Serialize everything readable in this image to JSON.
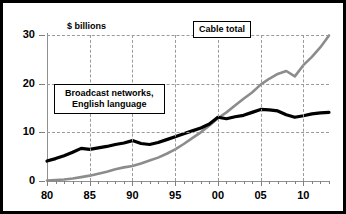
{
  "chart_data": {
    "type": "line",
    "title": "",
    "subtitle": "",
    "xlabel": "",
    "ylabel": "$ billions",
    "axis_note": "$ billions",
    "xlim": [
      1980,
      2013
    ],
    "ylim": [
      0,
      30
    ],
    "yticks": [
      0,
      10,
      20,
      30
    ],
    "ytick_labels": [
      "0",
      "10",
      "20",
      "30"
    ],
    "xticks": [
      1980,
      1985,
      1990,
      1995,
      2000,
      2005,
      2010
    ],
    "xtick_labels": [
      "80",
      "85",
      "90",
      "95",
      "00",
      "05",
      "10"
    ],
    "grid": true,
    "legend_position": "inline-callouts",
    "x": [
      1980,
      1981,
      1982,
      1983,
      1984,
      1985,
      1986,
      1987,
      1988,
      1989,
      1990,
      1991,
      1992,
      1993,
      1994,
      1995,
      1996,
      1997,
      1998,
      1999,
      2000,
      2001,
      2002,
      2003,
      2004,
      2005,
      2006,
      2007,
      2008,
      2009,
      2010,
      2011,
      2012,
      2013
    ],
    "series": [
      {
        "name": "Broadcast networks, English language",
        "color": "#000000",
        "style": "thick-black",
        "values": [
          4.1,
          4.6,
          5.2,
          5.9,
          6.7,
          6.5,
          6.8,
          7.1,
          7.5,
          7.8,
          8.3,
          7.7,
          7.5,
          7.9,
          8.5,
          9.1,
          9.7,
          10.3,
          10.9,
          11.7,
          13.1,
          12.8,
          13.2,
          13.5,
          14.1,
          14.7,
          14.6,
          14.4,
          13.6,
          13.1,
          13.4,
          13.8,
          14.0,
          14.1
        ]
      },
      {
        "name": "Cable total",
        "color": "#8c8c8c",
        "style": "gray",
        "values": [
          0.1,
          0.2,
          0.3,
          0.5,
          0.8,
          1.1,
          1.5,
          1.9,
          2.4,
          2.8,
          3.1,
          3.6,
          4.2,
          4.8,
          5.6,
          6.5,
          7.6,
          8.8,
          10.0,
          11.4,
          12.9,
          14.1,
          15.5,
          16.9,
          18.2,
          19.8,
          21.0,
          22.0,
          22.6,
          21.5,
          23.8,
          25.5,
          27.5,
          29.9
        ]
      }
    ],
    "annotations": [
      {
        "id": "cable-total",
        "text": "Cable total",
        "lines": [
          "Cable total"
        ]
      },
      {
        "id": "broadcast-networks",
        "text": "Broadcast networks, English language",
        "lines": [
          "Broadcast networks,",
          "English language"
        ]
      }
    ]
  }
}
